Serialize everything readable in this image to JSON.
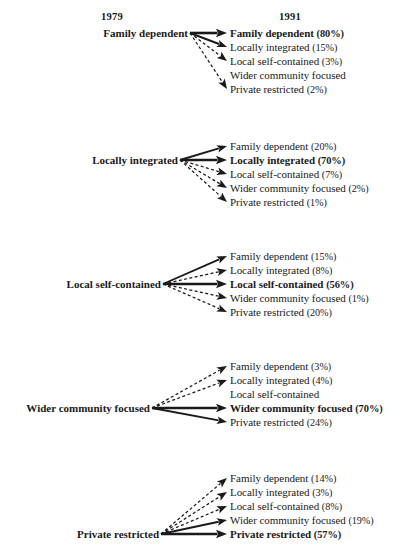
{
  "figure": {
    "type": "transition-flow-diagram",
    "headers": {
      "left": "1979",
      "right": "1991"
    },
    "categories": [
      "Family dependent",
      "Locally integrated",
      "Local self-contained",
      "Wider community focused",
      "Private restricted"
    ],
    "blocks": [
      {
        "source": "Family dependent",
        "source_index": 0,
        "targets": [
          {
            "label": "Family dependent",
            "pct": "(80%)",
            "value": 80,
            "style": "solid-thick",
            "highlight": true,
            "has_arrow": true
          },
          {
            "label": "Locally integrated",
            "pct": "(15%)",
            "value": 15,
            "style": "solid",
            "highlight": false,
            "has_arrow": true
          },
          {
            "label": "Local self-contained",
            "pct": "(3%)",
            "value": 3,
            "style": "dashed",
            "highlight": false,
            "has_arrow": true
          },
          {
            "label": "Wider community focused",
            "pct": "",
            "value": 0,
            "style": "none",
            "highlight": false,
            "has_arrow": false
          },
          {
            "label": "Private restricted",
            "pct": "(2%)",
            "value": 2,
            "style": "dashed",
            "highlight": false,
            "has_arrow": true
          }
        ]
      },
      {
        "source": "Locally integrated",
        "source_index": 1,
        "targets": [
          {
            "label": "Family dependent",
            "pct": "(20%)",
            "value": 20,
            "style": "solid",
            "highlight": false,
            "has_arrow": true
          },
          {
            "label": "Locally integrated",
            "pct": "(70%)",
            "value": 70,
            "style": "solid-thick",
            "highlight": true,
            "has_arrow": true
          },
          {
            "label": "Local self-contained",
            "pct": "(7%)",
            "value": 7,
            "style": "dashed",
            "highlight": false,
            "has_arrow": true
          },
          {
            "label": "Wider community focused",
            "pct": "(2%)",
            "value": 2,
            "style": "dashed",
            "highlight": false,
            "has_arrow": true
          },
          {
            "label": "Private restricted",
            "pct": "(1%)",
            "value": 1,
            "style": "dashed",
            "highlight": false,
            "has_arrow": true
          }
        ]
      },
      {
        "source": "Local self-contained",
        "source_index": 2,
        "targets": [
          {
            "label": "Family dependent",
            "pct": "(15%)",
            "value": 15,
            "style": "solid",
            "highlight": false,
            "has_arrow": true
          },
          {
            "label": "Locally integrated",
            "pct": "(8%)",
            "value": 8,
            "style": "dashed",
            "highlight": false,
            "has_arrow": true
          },
          {
            "label": "Local self-contained",
            "pct": "(56%)",
            "value": 56,
            "style": "solid-thick",
            "highlight": true,
            "has_arrow": true
          },
          {
            "label": "Wider community focused",
            "pct": "(1%)",
            "value": 1,
            "style": "dashed",
            "highlight": false,
            "has_arrow": true
          },
          {
            "label": "Private restricted",
            "pct": "(20%)",
            "value": 20,
            "style": "dashed",
            "highlight": false,
            "has_arrow": true
          }
        ]
      },
      {
        "source": "Wider community focused",
        "source_index": 3,
        "targets": [
          {
            "label": "Family dependent",
            "pct": "(3%)",
            "value": 3,
            "style": "dashed",
            "highlight": false,
            "has_arrow": true
          },
          {
            "label": "Locally integrated",
            "pct": "(4%)",
            "value": 4,
            "style": "dashed",
            "highlight": false,
            "has_arrow": true
          },
          {
            "label": "Local self-contained",
            "pct": "",
            "value": 0,
            "style": "none",
            "highlight": false,
            "has_arrow": false
          },
          {
            "label": "Wider community focused",
            "pct": "(70%)",
            "value": 70,
            "style": "solid-thick",
            "highlight": true,
            "has_arrow": true
          },
          {
            "label": "Private restricted",
            "pct": "(24%)",
            "value": 24,
            "style": "solid",
            "highlight": false,
            "has_arrow": true
          }
        ]
      },
      {
        "source": "Private restricted",
        "source_index": 4,
        "targets": [
          {
            "label": "Family dependent",
            "pct": "(14%)",
            "value": 14,
            "style": "dashed",
            "highlight": false,
            "has_arrow": true
          },
          {
            "label": "Locally integrated",
            "pct": "(3%)",
            "value": 3,
            "style": "dashed",
            "highlight": false,
            "has_arrow": true
          },
          {
            "label": "Local self-contained",
            "pct": "(8%)",
            "value": 8,
            "style": "dashed",
            "highlight": false,
            "has_arrow": true
          },
          {
            "label": "Wider community focused",
            "pct": "(19%)",
            "value": 19,
            "style": "solid",
            "highlight": false,
            "has_arrow": true
          },
          {
            "label": "Private restricted",
            "pct": "(57%)",
            "value": 57,
            "style": "solid-thick",
            "highlight": true,
            "has_arrow": true
          }
        ]
      }
    ]
  },
  "layout": {
    "header_y": 16,
    "header_left_x": 112,
    "header_right_x": 290,
    "block_top_y": [
      33,
      146,
      256,
      366,
      478
    ],
    "row_gap": 14,
    "source_right_x": [
      188,
      178,
      161,
      150,
      159
    ],
    "hub_x": [
      190,
      180,
      163,
      152,
      161
    ],
    "dest_text_x": 230,
    "arrow_tip_x": 227
  },
  "colors": {
    "ink": "#1a1a1a",
    "background": "#ffffff"
  }
}
